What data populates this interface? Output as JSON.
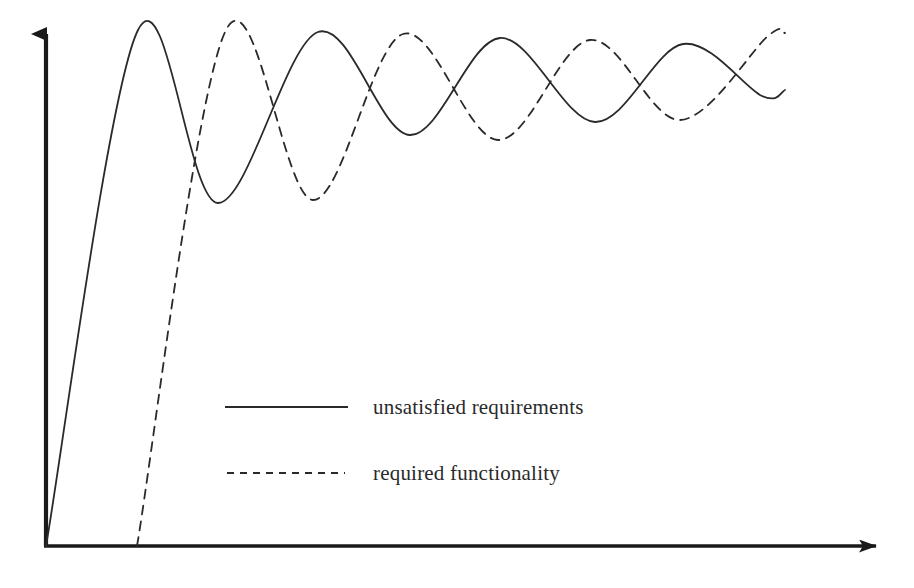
{
  "figure": {
    "background_color": "#ffffff",
    "ink_color": "#2a2a2a",
    "axis_color": "#1a1a1a"
  },
  "axes": {
    "origin": {
      "x": 46,
      "y": 546
    },
    "y_axis": {
      "name": "vertical-axis",
      "x": 46,
      "y_top": 20,
      "y_bottom": 546,
      "arrow": "up",
      "label": ""
    },
    "x_axis": {
      "name": "horizontal-axis",
      "y": 546,
      "x_left": 46,
      "x_right": 890,
      "arrow": "right",
      "label": ""
    },
    "tick_labels": [],
    "grid": false
  },
  "legend": {
    "position": "center",
    "entries": [
      {
        "label": "unsatisfied requirements",
        "style": "solid",
        "swatch": {
          "x1": 225,
          "x2": 348,
          "y": 407
        }
      },
      {
        "label": "required functionality",
        "style": "dashed",
        "swatch": {
          "x1": 227,
          "x2": 345,
          "y": 473
        }
      }
    ]
  },
  "chart_data": {
    "type": "line",
    "title": "",
    "subtitle": "",
    "xlabel": "time",
    "ylabel": "amount",
    "xlim": [
      0,
      914
    ],
    "ylim": [
      0,
      546
    ],
    "grid": false,
    "legend_position": "center",
    "annotations": [],
    "series": [
      {
        "name": "unsatisfied requirements",
        "style": "solid",
        "color": "#2a2a2a",
        "start": {
          "x": 46,
          "y": 546
        },
        "end": {
          "x": 785,
          "y": 90
        },
        "equilibrium_y": 78,
        "extrema": [
          {
            "kind": "peak",
            "x": 138,
            "y": 30
          },
          {
            "kind": "trough",
            "x": 218,
            "y": 203
          },
          {
            "kind": "peak",
            "x": 318,
            "y": 32
          },
          {
            "kind": "trough",
            "x": 410,
            "y": 135
          },
          {
            "kind": "peak",
            "x": 500,
            "y": 38
          },
          {
            "kind": "trough",
            "x": 595,
            "y": 122
          },
          {
            "kind": "peak",
            "x": 683,
            "y": 44
          },
          {
            "kind": "trough",
            "x": 762,
            "y": 96
          }
        ]
      },
      {
        "name": "required functionality",
        "style": "dashed",
        "color": "#2a2a2a",
        "start": {
          "x": 137,
          "y": 546
        },
        "end": {
          "x": 785,
          "y": 33
        },
        "equilibrium_y": 78,
        "extrema": [
          {
            "kind": "peak",
            "x": 226,
            "y": 30
          },
          {
            "kind": "trough",
            "x": 313,
            "y": 200
          },
          {
            "kind": "peak",
            "x": 403,
            "y": 34
          },
          {
            "kind": "trough",
            "x": 498,
            "y": 140
          },
          {
            "kind": "peak",
            "x": 590,
            "y": 40
          },
          {
            "kind": "trough",
            "x": 680,
            "y": 120
          },
          {
            "kind": "peak",
            "x": 768,
            "y": 36
          }
        ]
      }
    ]
  }
}
